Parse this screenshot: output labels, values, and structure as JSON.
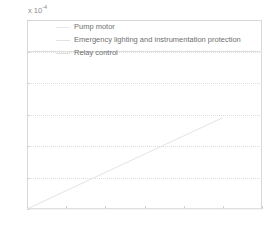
{
  "chart_data": {
    "type": "line",
    "title": "",
    "xlabel": "",
    "ylabel": "",
    "exponent_prefix": "x 10",
    "exponent_power": "-4",
    "y_scale": 0.0001,
    "xlim": [
      0,
      30
    ],
    "ylim": [
      0,
      1.2
    ],
    "grid": true,
    "grid_axis": "y",
    "legend_position": "top-left-inside",
    "xticks": [
      0,
      5,
      10,
      15,
      20,
      25,
      30
    ],
    "xtick_labels": [
      "0",
      "5",
      "10",
      "15",
      "20",
      "25",
      "30"
    ],
    "yticks": [
      0,
      0.2,
      0.4,
      0.6,
      0.8,
      1,
      1.2
    ],
    "ytick_labels": [
      "0",
      "0.2",
      "0.4",
      "0.6",
      "0.8",
      "1",
      "1.2"
    ],
    "series": [
      {
        "name": "Pump motor",
        "color": "#e8e8e8",
        "x": [
          0,
          5,
          10,
          15,
          20,
          25,
          30
        ],
        "values": [
          0,
          0,
          0,
          0,
          0,
          0,
          0
        ]
      },
      {
        "name": "Emergency lighting and instrumentation protection",
        "color": "#e3e3e3",
        "x": [
          0,
          2.5,
          5,
          7.5,
          10,
          12.5,
          15,
          17.5,
          20,
          22.5,
          25
        ],
        "values": [
          0,
          0.058,
          0.116,
          0.174,
          0.232,
          0.29,
          0.348,
          0.406,
          0.464,
          0.522,
          0.58
        ]
      },
      {
        "name": "Relay control",
        "color": "#e0e0e0",
        "x": [
          0,
          5,
          10,
          15,
          20,
          25,
          30
        ],
        "values": [
          1.0,
          1.0,
          1.0,
          1.0,
          1.0,
          1.0,
          1.0
        ]
      }
    ]
  },
  "legend": {
    "entries": [
      {
        "label": "Pump motor"
      },
      {
        "label": "Emergency lighting and instrumentation protection"
      },
      {
        "label": "Relay control"
      }
    ]
  }
}
